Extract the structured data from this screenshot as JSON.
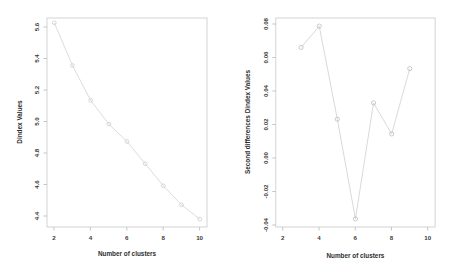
{
  "chart_data": [
    {
      "type": "line",
      "panel": "left",
      "title": "",
      "xlabel": "Number of clusters",
      "ylabel": "Dindex Values",
      "x": [
        2,
        3,
        4,
        5,
        6,
        7,
        8,
        9,
        10
      ],
      "values": [
        5.6,
        5.33,
        5.11,
        4.96,
        4.85,
        4.71,
        4.57,
        4.45,
        4.36
      ],
      "xticks": [
        2,
        4,
        6,
        8,
        10
      ],
      "yticks": [
        "5.6",
        "5.4",
        "5.2",
        "5.0",
        "4.8",
        "4.6",
        "4.4"
      ],
      "ytick_values": [
        5.6,
        5.4,
        5.2,
        5.0,
        4.8,
        4.6,
        4.4
      ],
      "xlim": [
        1.6,
        10.4
      ],
      "ylim": [
        4.31,
        5.63
      ],
      "grid": false,
      "legend": "none",
      "marker": "circle",
      "line_color": "#d8d8d8",
      "marker_color": "#d2d2d2"
    },
    {
      "type": "line",
      "panel": "right",
      "title": "",
      "xlabel": "Number of clusters",
      "ylabel": "Second differences Dindex Values",
      "x": [
        3,
        4,
        5,
        6,
        7,
        8,
        9
      ],
      "values": [
        0.065,
        0.078,
        0.021,
        -0.04,
        0.031,
        0.012,
        0.052
      ],
      "xticks": [
        2,
        4,
        6,
        8,
        10
      ],
      "yticks": [
        "0.08",
        "0.06",
        "0.04",
        "0.02",
        "0.00",
        "-0.02",
        "-0.04"
      ],
      "ytick_values": [
        0.08,
        0.06,
        0.04,
        0.02,
        0.0,
        -0.02,
        -0.04
      ],
      "xlim": [
        1.6,
        10.4
      ],
      "ylim": [
        -0.045,
        0.083
      ],
      "grid": false,
      "legend": "none",
      "marker": "circle",
      "line_color": "#cfcfcf",
      "marker_color": "#c4c4c4"
    }
  ],
  "left_panel": {
    "name": "Dindex plot",
    "xlabel": "Number of clusters",
    "ylabel": "Dindex Values",
    "xticklabels": [
      "2",
      "4",
      "6",
      "8",
      "10"
    ],
    "yticklabels": [
      "5.6",
      "5.4",
      "5.2",
      "5.0",
      "4.8",
      "4.6",
      "4.4"
    ]
  },
  "right_panel": {
    "name": "Second differences Dindex plot",
    "xlabel": "Number of clusters",
    "ylabel": "Second differences Dindex Values",
    "xticklabels": [
      "2",
      "4",
      "6",
      "8",
      "10"
    ],
    "yticklabels": [
      "0.08",
      "0.06",
      "0.04",
      "0.02",
      "0.00",
      "-0.02",
      "-0.04"
    ]
  },
  "colors": {
    "background": "#ffffff",
    "frame": "#c9c9c9",
    "line_left": "#d8d8d8",
    "line_right": "#cfcfcf",
    "text": "#2e2e2e"
  }
}
